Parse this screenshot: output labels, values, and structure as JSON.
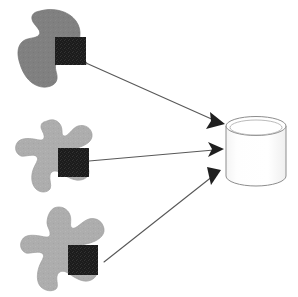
{
  "figure": {
    "title": "Data sources feeding a central database",
    "background_color": "#ffffff",
    "width": 298,
    "height": 297
  },
  "palette": {
    "blob_dark_gray": "#808080",
    "blob_light_gray": "#adadad",
    "blob_outline": "#9a9a9a",
    "square_dark": "#1c1c1c",
    "square_noise": "#2e2e2e",
    "arrow_line": "#585858",
    "arrow_head": "#1f1f1f",
    "cylinder_fill": "#fdfdfd",
    "cylinder_stroke": "#8d8d8d",
    "cylinder_top_fill": "#ffffff"
  },
  "nodes": {
    "sources": [
      {
        "id": "source-top",
        "semantic_name": "data-source-blob-top",
        "shape": "amoeba-blob",
        "fill": "#808080",
        "label": "",
        "artifact": {
          "semantic_name": "data-artifact-square-top",
          "shape": "square",
          "fill": "#1c1c1c",
          "label": "",
          "x": 55,
          "y": 37,
          "width": 31,
          "height": 28
        },
        "bbox": {
          "x": 14,
          "y": 9,
          "width": 75,
          "height": 78
        }
      },
      {
        "id": "source-middle",
        "semantic_name": "data-source-blob-middle",
        "shape": "star-amoeba-blob",
        "fill": "#adadad",
        "label": "",
        "artifact": {
          "semantic_name": "data-artifact-square-middle",
          "shape": "square",
          "fill": "#1c1c1c",
          "label": "",
          "x": 58,
          "y": 148,
          "width": 31,
          "height": 29
        },
        "bbox": {
          "x": 16,
          "y": 120,
          "width": 78,
          "height": 72
        }
      },
      {
        "id": "source-bottom",
        "semantic_name": "data-source-blob-bottom",
        "shape": "star-amoeba-blob",
        "fill": "#adadad",
        "label": "",
        "artifact": {
          "semantic_name": "data-artifact-square-bottom",
          "shape": "square",
          "fill": "#1c1c1c",
          "label": "",
          "x": 68,
          "y": 245,
          "width": 30,
          "height": 30
        },
        "bbox": {
          "x": 22,
          "y": 207,
          "width": 82,
          "height": 80
        }
      }
    ],
    "target": {
      "id": "database",
      "semantic_name": "database-cylinder",
      "shape": "cylinder",
      "label": "",
      "fill": "#fdfdfd",
      "stroke": "#8d8d8d",
      "bbox": {
        "x": 226,
        "y": 117,
        "width": 60,
        "height": 69
      }
    }
  },
  "edges": [
    {
      "id": "edge-top",
      "semantic_name": "arrow-top-source-to-database",
      "from": "source-top",
      "to": "database",
      "label": "",
      "arrowhead": "solid-triangle",
      "path": {
        "x1": 86,
        "y1": 63,
        "x2": 219,
        "y2": 123
      }
    },
    {
      "id": "edge-middle",
      "semantic_name": "arrow-middle-source-to-database",
      "from": "source-middle",
      "to": "database",
      "label": "",
      "arrowhead": "solid-triangle",
      "path": {
        "x1": 89,
        "y1": 161,
        "x2": 219,
        "y2": 149
      }
    },
    {
      "id": "edge-bottom",
      "semantic_name": "arrow-bottom-source-to-database",
      "from": "source-bottom",
      "to": "database",
      "label": "",
      "arrowhead": "solid-triangle",
      "path": {
        "x1": 104,
        "y1": 262,
        "x2": 216,
        "y2": 173
      }
    }
  ]
}
